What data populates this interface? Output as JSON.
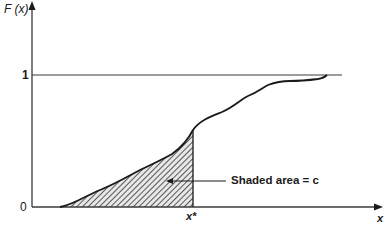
{
  "diagram": {
    "y_axis_label": "F (x)",
    "x_axis_label": "x",
    "y_tick_one": "1",
    "y_tick_zero": "0",
    "x_marker_label": "x*",
    "annotation": "Shaded area = c",
    "colors": {
      "line": "#1a1a1a",
      "axis": "#3a3a3a",
      "hatch": "#333333",
      "background": "#ffffff"
    }
  }
}
